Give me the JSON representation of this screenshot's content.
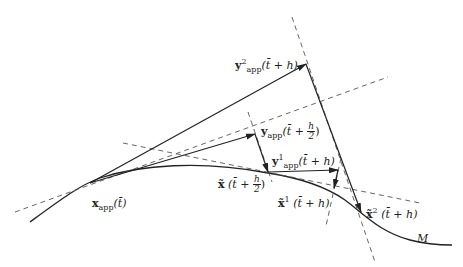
{
  "diagram": {
    "labels": {
      "x_app": {
        "bold": "x",
        "sub": "app",
        "arg": "(t̄)"
      },
      "y2_app": {
        "bold": "y",
        "sup": "2",
        "sub": "app",
        "arg": "(t̄ + h)"
      },
      "y_app_half": {
        "bold": "y",
        "sub": "app",
        "arg_pre": "(t̄ + ",
        "frac_num": "h",
        "frac_den": "2",
        "arg_post": ")"
      },
      "y1_app": {
        "bold": "y",
        "sup": "1",
        "sub": "app",
        "arg": "(t̄ + h)"
      },
      "x_tilde_half": {
        "bold": "x̃",
        "arg_pre": " (t̄ + ",
        "frac_num": "h",
        "frac_den": "2",
        "arg_post": ")"
      },
      "x_tilde_1": {
        "bold": "x̃",
        "sup": "1",
        "arg": " (t̄ + h)"
      },
      "x_tilde_2": {
        "bold": "x̃",
        "sup": "2",
        "arg": " (t̄ + h)"
      },
      "manifold": "M"
    },
    "colors": {
      "line": "#222222",
      "dash": "#555555"
    }
  }
}
